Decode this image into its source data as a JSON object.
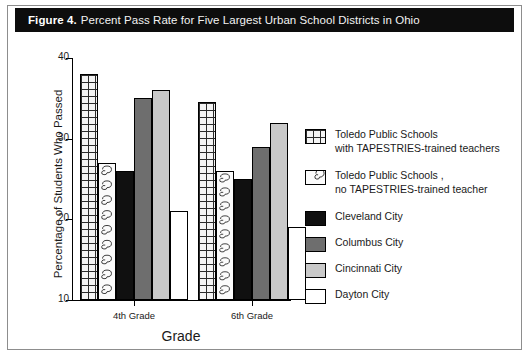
{
  "figure": {
    "number_label": "Figure 4.",
    "title": "Percent Pass Rate for Five Largest Urban School Districts in Ohio"
  },
  "chart_data": {
    "type": "bar",
    "title": "Percent Pass Rate for Five Largest Urban School Districts in Ohio",
    "xlabel": "Grade",
    "ylabel": "Percentage of Students Who Passed",
    "categories": [
      "4th Grade",
      "6th Grade"
    ],
    "ylim": [
      10,
      40
    ],
    "yticks": [
      10,
      20,
      30,
      40
    ],
    "grid": false,
    "legend_position": "right",
    "series": [
      {
        "name": "Toledo Public Schools with TAPESTRIES-trained teachers",
        "fill": "cross-hatch-grid",
        "color": "#f4f4f4",
        "values": [
          38,
          34.5
        ]
      },
      {
        "name": "Toledo Public Schools , no TAPESTRIES-trained teacher",
        "fill": "swirl-pattern",
        "color": "#fbfbfb",
        "values": [
          27,
          26
        ]
      },
      {
        "name": "Cleveland City",
        "fill": "solid",
        "color": "#101010",
        "values": [
          26,
          25
        ]
      },
      {
        "name": "Columbus City",
        "fill": "solid",
        "color": "#6e6e6e",
        "values": [
          35,
          29
        ]
      },
      {
        "name": "Cincinnati City",
        "fill": "solid",
        "color": "#c9c9c9",
        "values": [
          36,
          32
        ]
      },
      {
        "name": "Dayton City",
        "fill": "solid",
        "color": "#ffffff",
        "values": [
          21,
          19
        ]
      }
    ]
  },
  "axis": {
    "y_title": "Percentage of Students Who Passed",
    "x_title": "Grade",
    "y_tick_labels": [
      "40",
      "30",
      "20",
      "10"
    ],
    "x_tick_labels": [
      "4th Grade",
      "6th Grade"
    ]
  },
  "legend": {
    "items": [
      {
        "label": "Toledo Public Schools\nwith TAPESTRIES-trained teachers",
        "swatch": "grid",
        "color": "#f4f4f4"
      },
      {
        "label": "Toledo Public Schools ,\nno TAPESTRIES-trained teacher",
        "swatch": "swirl",
        "color": "#fbfbfb"
      },
      {
        "label": "Cleveland City",
        "swatch": "solid",
        "color": "#101010"
      },
      {
        "label": "Columbus City",
        "swatch": "solid",
        "color": "#6e6e6e"
      },
      {
        "label": "Cincinnati City",
        "swatch": "solid",
        "color": "#c9c9c9"
      },
      {
        "label": "Dayton City",
        "swatch": "solid",
        "color": "#ffffff"
      }
    ]
  }
}
